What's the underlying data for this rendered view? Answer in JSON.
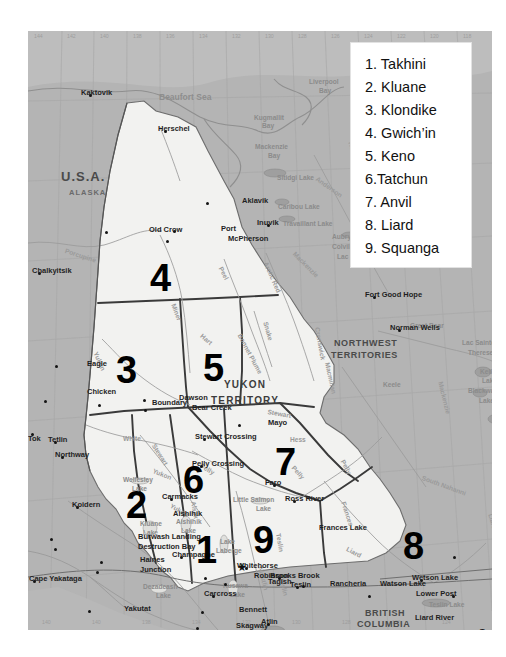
{
  "legend": {
    "title": "Yukon First Nations regions legend",
    "items": [
      {
        "num": "1.",
        "label": "Takhini"
      },
      {
        "num": "2.",
        "label": "Kluane"
      },
      {
        "num": "3.",
        "label": "Klondike"
      },
      {
        "num": "4.",
        "label": "Gwich’in"
      },
      {
        "num": "5.",
        "label": "Keno"
      },
      {
        "num": "6.",
        "label": "Tatchun"
      },
      {
        "num": "7.",
        "label": "Anvil"
      },
      {
        "num": "8.",
        "label": "Liard"
      },
      {
        "num": "9.",
        "label": "Squanga"
      }
    ],
    "entries_text": [
      "1. Takhini",
      "2. Kluane",
      "3. Klondike",
      "4. Gwich’in",
      "5. Keno",
      "6.Tatchun",
      "7. Anvil",
      "8. Liard",
      "9. Squanga"
    ]
  },
  "map": {
    "regions": [
      {
        "id": "1",
        "name": "Takhini",
        "x": 168,
        "y": 500
      },
      {
        "id": "2",
        "name": "Kluane",
        "x": 98,
        "y": 455
      },
      {
        "id": "3",
        "name": "Klondike",
        "x": 88,
        "y": 320
      },
      {
        "id": "4",
        "name": "Gwich’in",
        "x": 122,
        "y": 228
      },
      {
        "id": "5",
        "name": "Keno",
        "x": 175,
        "y": 318
      },
      {
        "id": "6",
        "name": "Tatchun",
        "x": 155,
        "y": 430
      },
      {
        "id": "7",
        "name": "Anvil",
        "x": 247,
        "y": 412
      },
      {
        "id": "8",
        "name": "Liard",
        "x": 375,
        "y": 496
      },
      {
        "id": "9",
        "name": "Squanga",
        "x": 225,
        "y": 490
      }
    ],
    "territory_labels": [
      {
        "text": "YUKON",
        "x": 196,
        "y": 349
      },
      {
        "text": "TERRITORY",
        "x": 183,
        "y": 365
      },
      {
        "text": "NORTHWEST",
        "x": 306,
        "y": 308
      },
      {
        "text": "TERRITORIES",
        "x": 303,
        "y": 320
      },
      {
        "text": "BRITISH",
        "x": 337,
        "y": 578
      },
      {
        "text": "COLUMBIA",
        "x": 329,
        "y": 589
      },
      {
        "text": "NUNAVUT",
        "x": 484,
        "y": 160
      },
      {
        "text": "U.S.A.",
        "x": 33,
        "y": 139
      },
      {
        "text": "ALASKA",
        "x": 41,
        "y": 158
      }
    ],
    "water_labels": [
      {
        "text": "Beaufort Sea",
        "x": 131,
        "y": 62,
        "size": "lg"
      },
      {
        "text": "Gulf of Alaska",
        "x": 25,
        "y": 604,
        "size": "lg"
      },
      {
        "text": "Mackenzie",
        "x": 227,
        "y": 113,
        "size": "sm"
      },
      {
        "text": "Bay",
        "x": 240,
        "y": 122,
        "size": "sm"
      },
      {
        "text": "Liverpool",
        "x": 281,
        "y": 48,
        "size": "sm"
      },
      {
        "text": "Bay",
        "x": 291,
        "y": 57,
        "size": "sm"
      },
      {
        "text": "Sitidgi Lake",
        "x": 249,
        "y": 144,
        "size": "sm"
      },
      {
        "text": "Caribou Lake",
        "x": 250,
        "y": 173,
        "size": "sm"
      },
      {
        "text": "Travaillant Lake",
        "x": 255,
        "y": 190,
        "size": "sm"
      },
      {
        "text": "Aubry Lake",
        "x": 304,
        "y": 203,
        "size": "sm"
      },
      {
        "text": "Colville Lake",
        "x": 304,
        "y": 213,
        "size": "sm"
      },
      {
        "text": "Lac Belot",
        "x": 309,
        "y": 223,
        "size": "sm"
      },
      {
        "text": "Great Bear",
        "x": 382,
        "y": 292,
        "size": "sm"
      },
      {
        "text": "Lac Sainte",
        "x": 434,
        "y": 309,
        "size": "sm"
      },
      {
        "text": "Therese",
        "x": 440,
        "y": 319,
        "size": "sm"
      },
      {
        "text": "Keller",
        "x": 452,
        "y": 338,
        "size": "sm"
      },
      {
        "text": "Lake",
        "x": 454,
        "y": 347,
        "size": "sm"
      },
      {
        "text": "Blackwater",
        "x": 440,
        "y": 357,
        "size": "sm"
      },
      {
        "text": "Lake",
        "x": 451,
        "y": 367,
        "size": "sm"
      },
      {
        "text": "Fish",
        "x": 466,
        "y": 385,
        "size": "sm"
      },
      {
        "text": "Lake",
        "x": 464,
        "y": 394,
        "size": "sm"
      },
      {
        "text": "Kugmallit",
        "x": 226,
        "y": 84,
        "size": "sm"
      },
      {
        "text": "Bay",
        "x": 234,
        "y": 92,
        "size": "sm"
      },
      {
        "text": "Wellesley",
        "x": 95,
        "y": 446,
        "size": "sm"
      },
      {
        "text": "Lake",
        "x": 104,
        "y": 455,
        "size": "sm"
      },
      {
        "text": "Aishihik",
        "x": 148,
        "y": 488,
        "size": "sm"
      },
      {
        "text": "Lake",
        "x": 153,
        "y": 497,
        "size": "sm"
      },
      {
        "text": "Kluane",
        "x": 112,
        "y": 490,
        "size": "sm"
      },
      {
        "text": "Lake",
        "x": 115,
        "y": 499,
        "size": "sm"
      },
      {
        "text": "Lake",
        "x": 192,
        "y": 508,
        "size": "sm"
      },
      {
        "text": "Laberge",
        "x": 188,
        "y": 517,
        "size": "sm"
      },
      {
        "text": "Dezadeash",
        "x": 115,
        "y": 553,
        "size": "sm"
      },
      {
        "text": "Lake",
        "x": 128,
        "y": 562,
        "size": "sm"
      },
      {
        "text": "Kusawa",
        "x": 195,
        "y": 552,
        "size": "sm"
      },
      {
        "text": "Lake",
        "x": 202,
        "y": 561,
        "size": "sm"
      },
      {
        "text": "Little Salmon",
        "x": 205,
        "y": 466,
        "size": "sm"
      },
      {
        "text": "Lake",
        "x": 228,
        "y": 475,
        "size": "sm"
      },
      {
        "text": "Teslin Lake",
        "x": 401,
        "y": 571,
        "size": "sm"
      },
      {
        "text": "Atlin Lake",
        "x": 243,
        "y": 601,
        "size": "sm"
      },
      {
        "text": "Frances Lake",
        "x": 291,
        "y": 493,
        "size": "place"
      },
      {
        "text": "Watson Lake",
        "x": 352,
        "y": 549,
        "size": "place"
      },
      {
        "text": "Summit Lake",
        "x": 447,
        "y": 614,
        "size": "place"
      },
      {
        "text": "Toad River",
        "x": 452,
        "y": 597,
        "size": "place"
      },
      {
        "text": "Muncho Lake",
        "x": 405,
        "y": 599,
        "size": "place"
      },
      {
        "text": "Liard River",
        "x": 387,
        "y": 583,
        "size": "place"
      },
      {
        "text": "Keele",
        "x": 355,
        "y": 351,
        "size": "sm"
      }
    ],
    "rivers": [
      {
        "text": "Porcupine",
        "x": 38,
        "y": 217,
        "rot": 18
      },
      {
        "text": "Peel",
        "x": 195,
        "y": 235,
        "rot": 62
      },
      {
        "text": "Arctic Red",
        "x": 240,
        "y": 230,
        "rot": 66
      },
      {
        "text": "Snake",
        "x": 240,
        "y": 290,
        "rot": 74
      },
      {
        "text": "Bonnet Plume",
        "x": 214,
        "y": 302,
        "rot": 62
      },
      {
        "text": "Miner",
        "x": 148,
        "y": 272,
        "rot": 70
      },
      {
        "text": "Hart",
        "x": 175,
        "y": 302,
        "rot": 40
      },
      {
        "text": "Yukon",
        "x": 70,
        "y": 320,
        "rot": 66
      },
      {
        "text": "Yukon",
        "x": 126,
        "y": 437,
        "rot": 22
      },
      {
        "text": "Yukon",
        "x": 144,
        "y": 472,
        "rot": 30
      },
      {
        "text": "White",
        "x": 95,
        "y": 405,
        "rot": 0
      },
      {
        "text": "Stewart",
        "x": 128,
        "y": 412,
        "rot": 58
      },
      {
        "text": "Stewart",
        "x": 240,
        "y": 378,
        "rot": 10
      },
      {
        "text": "Pelly",
        "x": 174,
        "y": 432,
        "rot": 30
      },
      {
        "text": "Pelly",
        "x": 267,
        "y": 434,
        "rot": 48
      },
      {
        "text": "Pelly",
        "x": 317,
        "y": 428,
        "rot": 62
      },
      {
        "text": "Hess",
        "x": 262,
        "y": 406,
        "rot": 0
      },
      {
        "text": "Macmillan",
        "x": 302,
        "y": 331,
        "rot": 78
      },
      {
        "text": "Cranswick",
        "x": 292,
        "y": 296,
        "rot": 80
      },
      {
        "text": "Teslin",
        "x": 253,
        "y": 502,
        "rot": 80
      },
      {
        "text": "Teslin",
        "x": 256,
        "y": 546,
        "rot": 76
      },
      {
        "text": "Liard",
        "x": 320,
        "y": 515,
        "rot": 28
      },
      {
        "text": "Liard",
        "x": 465,
        "y": 482,
        "rot": 74
      },
      {
        "text": "South Nahanni",
        "x": 395,
        "y": 444,
        "rot": 20
      },
      {
        "text": "Mackenzie",
        "x": 415,
        "y": 350,
        "rot": 76
      },
      {
        "text": "Dease",
        "x": 383,
        "y": 604,
        "rot": 66
      },
      {
        "text": "Alsek",
        "x": 168,
        "y": 470,
        "rot": 80
      },
      {
        "text": "Horton",
        "x": 325,
        "y": 110,
        "rot": 72
      },
      {
        "text": "Anderson",
        "x": 290,
        "y": 145,
        "rot": 35
      },
      {
        "text": "Mackenzie",
        "x": 268,
        "y": 220,
        "rot": 45
      },
      {
        "text": "Nisutlin",
        "x": 235,
        "y": 535,
        "rot": 76
      },
      {
        "text": "Frances",
        "x": 318,
        "y": 470,
        "rot": 72
      }
    ],
    "places": [
      {
        "text": "Kaktovik",
        "x": 61,
        "y": 60,
        "dx": -8,
        "dy": 3
      },
      {
        "text": "Herschel",
        "x": 136,
        "y": 96,
        "dx": -6,
        "dy": 3
      },
      {
        "text": "Aklavik",
        "x": 178,
        "y": 168,
        "dx": 36,
        "dy": 3
      },
      {
        "text": "Inuvik",
        "x": 239,
        "y": 190,
        "dx": -10,
        "dy": 3
      },
      {
        "text": "Old Crow",
        "x": 77,
        "y": 197,
        "dx": 44,
        "dy": 3
      },
      {
        "text": "Port",
        "x": 145,
        "y": 196,
        "dx": 48,
        "dy": 3
      },
      {
        "text": "McPherson",
        "x": 138,
        "y": 206,
        "dx": 62,
        "dy": 3
      },
      {
        "text": "Chalkyitsik",
        "x": 10,
        "y": 238,
        "dx": -6,
        "dy": 3
      },
      {
        "text": "Fort Good Hope",
        "x": 345,
        "y": 262,
        "dx": -8,
        "dy": 3
      },
      {
        "text": "Norman Wells",
        "x": 370,
        "y": 295,
        "dx": -8,
        "dy": 3
      },
      {
        "text": "Eagle",
        "x": 27,
        "y": 331,
        "dx": 32,
        "dy": 3
      },
      {
        "text": "Chicken",
        "x": 16,
        "y": 359,
        "dx": 43,
        "dy": 10
      },
      {
        "text": "Boundary",
        "x": 70,
        "y": 370,
        "dx": 54,
        "dy": 3
      },
      {
        "text": "Dawson",
        "x": 115,
        "y": 365,
        "dx": 36,
        "dy": 3
      },
      {
        "text": "Bear Creek",
        "x": 116,
        "y": 375,
        "dx": 48,
        "dy": 3
      },
      {
        "text": "Tok",
        "x": 3,
        "y": 406,
        "dx": -3,
        "dy": -4
      },
      {
        "text": "Tetlin",
        "x": 26,
        "y": 407,
        "dx": -6,
        "dy": 3
      },
      {
        "text": "Northway",
        "x": 33,
        "y": 422,
        "dx": -6,
        "dy": 3
      },
      {
        "text": "Mayo",
        "x": 210,
        "y": 390,
        "dx": 30,
        "dy": 3
      },
      {
        "text": "Stewart Crossing",
        "x": 175,
        "y": 404,
        "dx": -8,
        "dy": 3
      },
      {
        "text": "Pelly Crossing",
        "x": 172,
        "y": 431,
        "dx": -8,
        "dy": 3
      },
      {
        "text": "Faro",
        "x": 245,
        "y": 450,
        "dx": -8,
        "dy": 3
      },
      {
        "text": "Ross River",
        "x": 265,
        "y": 466,
        "dx": -8,
        "dy": 3
      },
      {
        "text": "Carmacks",
        "x": 142,
        "y": 464,
        "dx": -8,
        "dy": 3
      },
      {
        "text": "Koidern",
        "x": 48,
        "y": 472,
        "dx": -4,
        "dy": 3
      },
      {
        "text": "Aishihik",
        "x": 111,
        "y": 481,
        "dx": 34,
        "dy": 3
      },
      {
        "text": "Burwash Landing",
        "x": 22,
        "y": 504,
        "dx": 88,
        "dy": 3
      },
      {
        "text": "Destruction Bay",
        "x": 26,
        "y": 514,
        "dx": 84,
        "dy": 3
      },
      {
        "text": "Champagne",
        "x": 152,
        "y": 522,
        "dx": -8,
        "dy": 3
      },
      {
        "text": "Haines",
        "x": 72,
        "y": 527,
        "dx": 40,
        "dy": 3
      },
      {
        "text": "Junction",
        "x": 68,
        "y": 537,
        "dx": 44,
        "dy": 3
      },
      {
        "text": "Whitehorse",
        "x": 217,
        "y": 533,
        "dx": -8,
        "dy": 3
      },
      {
        "text": "Robinson",
        "x": 176,
        "y": 543,
        "dx": 50,
        "dy": 3
      },
      {
        "text": "Tagish",
        "x": 196,
        "y": 549,
        "dx": 44,
        "dy": 3
      },
      {
        "text": "Carcross",
        "x": 184,
        "y": 561,
        "dx": -8,
        "dy": 3
      },
      {
        "text": "Brooks Brook",
        "x": 250,
        "y": 543,
        "dx": -8,
        "dy": 3
      },
      {
        "text": "Teslin",
        "x": 268,
        "y": 552,
        "dx": -6,
        "dy": 3
      },
      {
        "text": "Rancheria",
        "x": 274,
        "y": 551,
        "dx": 28,
        "dy": 3
      },
      {
        "text": "Lower Post",
        "x": 340,
        "y": 561,
        "dx": 48,
        "dy": 3
      },
      {
        "text": "Bennett",
        "x": 173,
        "y": 577,
        "dx": 38,
        "dy": 3
      },
      {
        "text": "Skagway",
        "x": 168,
        "y": 593,
        "dx": 40,
        "dy": 3
      },
      {
        "text": "Haines",
        "x": 171,
        "y": 604,
        "dx": 36,
        "dy": 3
      },
      {
        "text": "Atlin",
        "x": 239,
        "y": 589,
        "dx": -6,
        "dy": 3
      },
      {
        "text": "Cape Yakataga",
        "x": 5,
        "y": 546,
        "dx": -4,
        "dy": 3
      },
      {
        "text": "Yakutat",
        "x": 60,
        "y": 576,
        "dx": 36,
        "dy": 3
      },
      {
        "text": "Fort Liard",
        "x": 425,
        "y": 522,
        "dx": 44,
        "dy": 3
      },
      {
        "text": "Nelson Forks",
        "x": 424,
        "y": 561,
        "dx": 54,
        "dy": 3
      },
      {
        "text": "Wetson Lake",
        "x": 392,
        "y": 545,
        "dx": -8,
        "dy": 3
      }
    ],
    "capital": {
      "name": "Whitehorse",
      "marker": "star",
      "x": 209,
      "y": 531
    },
    "grid_top_labels": [
      "144",
      "142",
      "140",
      "138",
      "136",
      "134",
      "132",
      "130",
      "128",
      "126",
      "124",
      "122",
      "120",
      "118"
    ],
    "grid_bottom_labels": [
      "140",
      "140",
      "138",
      "134",
      "132",
      "130",
      "128",
      "126",
      "124"
    ]
  }
}
